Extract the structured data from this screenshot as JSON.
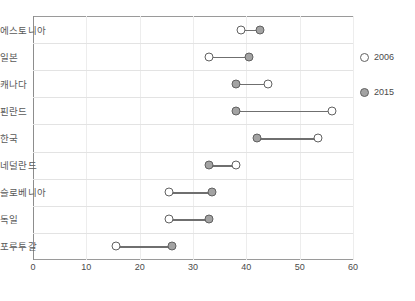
{
  "chart_data": {
    "type": "scatter",
    "subtype": "dumbbell-dot-plot",
    "title": "",
    "xlabel": "",
    "ylabel": "",
    "xlim": [
      0,
      60
    ],
    "xticks": [
      0,
      10,
      20,
      30,
      40,
      50,
      60
    ],
    "xtick_labels": [
      "0",
      "10",
      "20",
      "30",
      "40",
      "50",
      "60"
    ],
    "grid": true,
    "legend_position": "right",
    "categories": [
      "에스토니아",
      "일본",
      "캐나다",
      "핀란드",
      "한국",
      "네덜란드",
      "슬로베니아",
      "독일",
      "포루투갈"
    ],
    "series": [
      {
        "name": "2006",
        "marker": "open-circle",
        "color": "#ffffff",
        "edge_color": "#616161",
        "values": [
          39,
          33,
          44,
          56,
          53.5,
          38,
          25.5,
          25.5,
          15.5
        ]
      },
      {
        "name": "2015",
        "marker": "filled-circle",
        "color": "#a3a3a3",
        "edge_color": "#616161",
        "values": [
          42.5,
          40.5,
          38,
          38,
          42,
          33,
          33.5,
          33,
          26
        ]
      }
    ],
    "connector_color": "#6f6f6f"
  },
  "legend": {
    "items": [
      {
        "label": "2006",
        "marker": "open-circle"
      },
      {
        "label": "2015",
        "marker": "filled-circle"
      }
    ]
  }
}
